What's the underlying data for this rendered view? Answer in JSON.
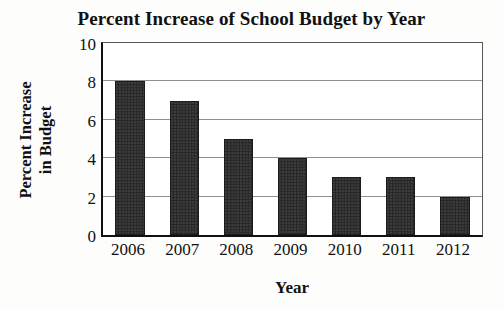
{
  "chart_data": {
    "type": "bar",
    "title": "Percent Increase of School Budget by Year",
    "xlabel": "Year",
    "ylabel": "Percent Increase in Budget",
    "ylabel_lines": [
      "Percent Increase",
      "in Budget"
    ],
    "categories": [
      "2006",
      "2007",
      "2008",
      "2009",
      "2010",
      "2011",
      "2012"
    ],
    "values": [
      8,
      7,
      5,
      4,
      3,
      3,
      2
    ],
    "ylim": [
      0,
      10
    ],
    "yticks": [
      10,
      8,
      6,
      4,
      2,
      0
    ],
    "grid": true,
    "grid_axis": "y",
    "legend": false,
    "bar_color": "#2b2b2b",
    "grid_color": "#8d8f92",
    "axis_color": "#111111",
    "background": "#ffffff"
  },
  "artifacts": {
    "bottom_smudge": "",
    "top_smudge": ""
  }
}
